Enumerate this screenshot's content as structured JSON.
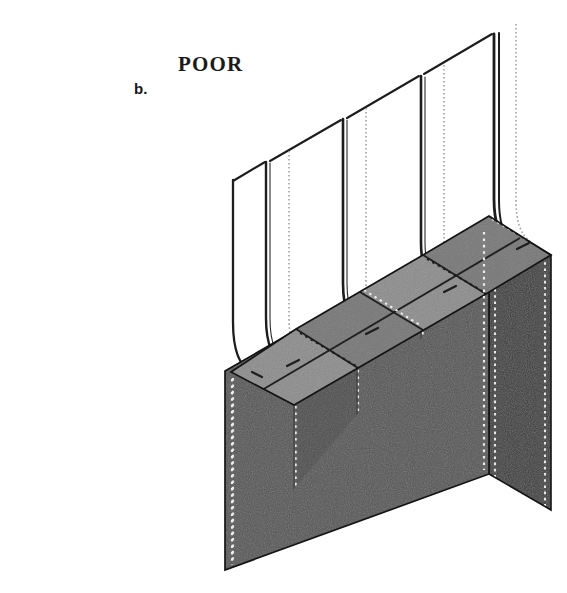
{
  "figure": {
    "part_label": "b.",
    "quality_label": "POOR"
  },
  "colors": {
    "background": "#ffffff",
    "top_face": "#8b8b8b",
    "top_face_shaded": "#818181",
    "front_face": "#545454",
    "front_face_shaded": "#4e4e4e",
    "end_face": "#3a3a3a",
    "outline": "#1d1d1d",
    "strap_line": "#212121",
    "stitch_light": "#f2f2f2",
    "stitch_dark": "#2a2a2a",
    "stitch_gray": "#9a9a9a"
  },
  "panels": {
    "upper_panel_count": 4,
    "upper_panel_fill": "#ffffff",
    "top_segment_count": 8,
    "front_panel_count": 4
  },
  "geometry": {
    "box_left_x": 225,
    "box_right_x": 551,
    "box_bottom_y": 570,
    "box_top_y": 224,
    "panel_top_y": 6
  }
}
